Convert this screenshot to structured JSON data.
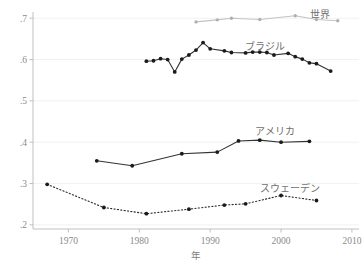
{
  "chart_data": {
    "type": "line",
    "title": "",
    "xlabel": "年",
    "ylabel": "",
    "xlim": [
      1965,
      2011
    ],
    "ylim": [
      0.19,
      0.715
    ],
    "grid": true,
    "legend_position": "inline-right-end-of-series",
    "xticks": [
      "1970",
      "1980",
      "1990",
      "2000",
      "2010"
    ],
    "xtick_values": [
      1970,
      1980,
      1990,
      2000,
      2010
    ],
    "yticks": [
      ".7",
      ".6",
      ".5",
      ".4",
      ".3",
      ".2"
    ],
    "ytick_values": [
      0.7,
      0.6,
      0.5,
      0.4,
      0.3,
      0.2
    ],
    "series": [
      {
        "name": "世界",
        "label": "世界",
        "color": "#c3c3c3",
        "marker_color": "#b0b0b0",
        "style": "solid",
        "x": [
          1988,
          1991,
          1993,
          1997,
          2002,
          2005,
          2008
        ],
        "values": [
          0.691,
          0.696,
          0.7,
          0.697,
          0.706,
          0.697,
          0.694
        ]
      },
      {
        "name": "ブラジル",
        "label": "ブラジル",
        "color": "#333333",
        "marker_color": "#1a1a1a",
        "style": "solid",
        "x": [
          1981,
          1982,
          1983,
          1984,
          1985,
          1986,
          1987,
          1988,
          1989,
          1990,
          1992,
          1993,
          1995,
          1996,
          1997,
          1998,
          1999,
          2001,
          2002,
          2003,
          2004,
          2005,
          2007
        ],
        "values": [
          0.596,
          0.597,
          0.602,
          0.6,
          0.57,
          0.601,
          0.611,
          0.623,
          0.641,
          0.626,
          0.621,
          0.617,
          0.616,
          0.618,
          0.618,
          0.617,
          0.611,
          0.615,
          0.607,
          0.601,
          0.592,
          0.59,
          0.572
        ]
      },
      {
        "name": "アメリカ",
        "label": "アメリカ",
        "color": "#333333",
        "marker_color": "#1a1a1a",
        "style": "solid",
        "x": [
          1974,
          1979,
          1986,
          1991,
          1994,
          1997,
          2000,
          2004
        ],
        "values": [
          0.355,
          0.343,
          0.372,
          0.376,
          0.403,
          0.405,
          0.4,
          0.402
        ]
      },
      {
        "name": "スウェーデン",
        "label": "スウェーデン",
        "color": "#2b2b2b",
        "marker_color": "#1a1a1a",
        "style": "dotted",
        "x": [
          1967,
          1975,
          1981,
          1987,
          1992,
          1995,
          2000,
          2005
        ],
        "values": [
          0.298,
          0.242,
          0.227,
          0.238,
          0.248,
          0.251,
          0.271,
          0.259
        ]
      }
    ],
    "series_label_positions": [
      {
        "name": "世界",
        "x": 320,
        "y": 18
      },
      {
        "name": "ブラジル",
        "x": 265,
        "y": 50
      },
      {
        "name": "アメリカ",
        "x": 275,
        "y": 135
      },
      {
        "name": "スウェーデン",
        "x": 290,
        "y": 192
      }
    ]
  }
}
